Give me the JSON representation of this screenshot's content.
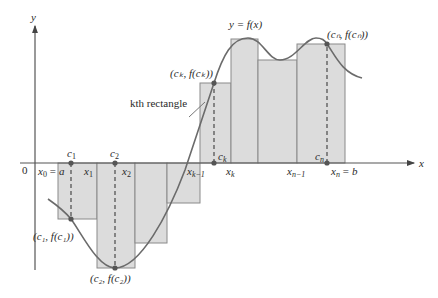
{
  "figure": {
    "colors": {
      "axis": "#555555",
      "curve": "#6b6b6b",
      "rect_fill": "#dcdcdc",
      "rect_stroke": "#8a8a8a",
      "point": "#555555",
      "text": "#2a2a2a"
    }
  },
  "axes": {
    "x_label": "x",
    "y_label": "y",
    "origin_label": "0"
  },
  "curve": {
    "label": "y = f(x)"
  },
  "x_ticks": {
    "x0": "x",
    "x0_sub": "0",
    "x0_eq": "= a",
    "x1": "x",
    "x1_sub": "1",
    "x2": "x",
    "x2_sub": "2",
    "xk1": "x",
    "xk1_sub": "k−1",
    "xk": "x",
    "xk_sub": "k",
    "xn1": "x",
    "xn1_sub": "n−1",
    "xn": "x",
    "xn_sub": "n",
    "xn_eq": "= b"
  },
  "c_labels": {
    "c1": "c",
    "c1_sub": "1",
    "c2": "c",
    "c2_sub": "2",
    "ck": "c",
    "ck_sub": "k",
    "cn": "c",
    "cn_sub": "n"
  },
  "point_labels": {
    "p1": "(c₁, f(c₁))",
    "p2": "(c₂, f(c₂))",
    "pk": "(cₖ, f(cₖ))",
    "pn": "(cₙ, f(cₙ))"
  },
  "annotations": {
    "kth_rectangle": "kth rectangle"
  }
}
